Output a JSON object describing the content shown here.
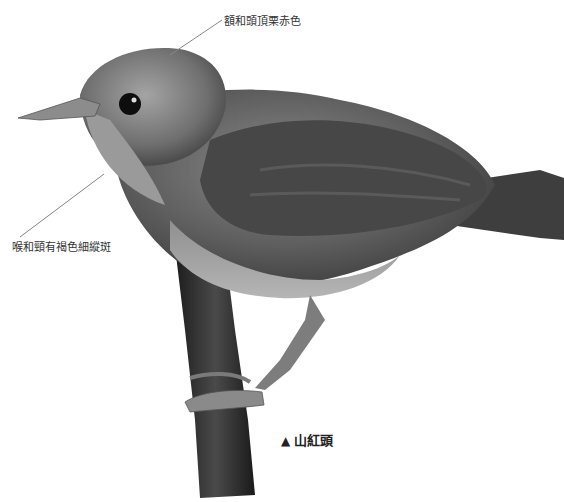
{
  "illustration": {
    "subject": "bird-on-branch",
    "labels": {
      "crown": "額和頭頂栗赤色",
      "throat": "喉和頸有褐色細縱斑"
    },
    "caption": {
      "marker": "▲",
      "title": "山紅頭"
    }
  }
}
